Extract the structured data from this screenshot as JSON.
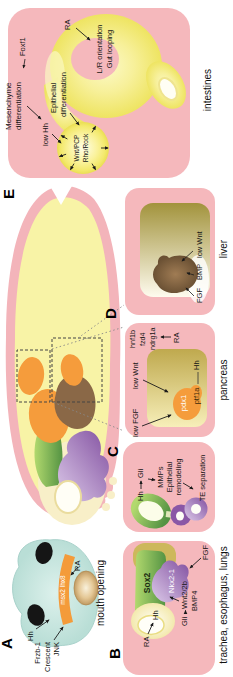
{
  "figure": {
    "panels": {
      "a": {
        "letter": "A",
        "caption": "mouth opening",
        "hh": "Hh",
        "ra": "RA",
        "band": "msx2 lhx8",
        "frzb": "Frzb-1",
        "crescent": "Crescent",
        "jnk": "JNK"
      },
      "b": {
        "letter": "B",
        "caption": "trachea, esophagus, lungs",
        "sox2": "Sox2",
        "nkx21": "Nkx2-1",
        "ra": "RA",
        "hh": "Hh",
        "gli": "Gli",
        "wnt22b": "Wnt2/2b",
        "bmp4": "BMP4",
        "fgf": "FGF",
        "hh2": "Hh",
        "gli2": "Gli",
        "mmps": "MMPs",
        "epithelial": "Epithelial",
        "remodeling": "remodeling",
        "te_separation": "TE separation"
      },
      "c": {
        "letter": "C",
        "caption": "pancreas",
        "low_fgf": "low FGF",
        "low_wnt": "low Wnt",
        "pdx1": "pdx1",
        "ptf1a": "ptf1a",
        "hh": "Hh",
        "hnf1b": "hnf1b",
        "fzd4": "fzd4",
        "ndrg1a": "ndrg1a",
        "ra": "RA"
      },
      "d": {
        "letter": "D",
        "caption": "liver",
        "fgf": "FGF",
        "bmp": "BMP",
        "low_wnt": "low Wnt"
      },
      "e": {
        "letter": "E",
        "caption": "intestines",
        "mesenchyme_line1": "Mesenchyme",
        "mesenchyme_line2": "differentiation",
        "foxf1": "Foxf1",
        "low_hh": "low Hh",
        "epithelial_line1": "Epithelial",
        "epithelial_line2": "differentiation",
        "wnt_pcp": "Wnt/PCP",
        "rho_rock": "Rho/Rock",
        "ra": "RA",
        "lr_orientation": "L/R orientation",
        "gut_looping": "Gut looping"
      }
    },
    "colors": {
      "panel_pink": "#f5b8bc",
      "gut_yellow": "#f3ea74",
      "orange": "#f59c3c",
      "green": "#6fae4e",
      "purple": "#8a57a6",
      "liver_brown": "#8a6847",
      "head_cyan": "#cde9e4",
      "khaki": "#cdb85c"
    }
  }
}
